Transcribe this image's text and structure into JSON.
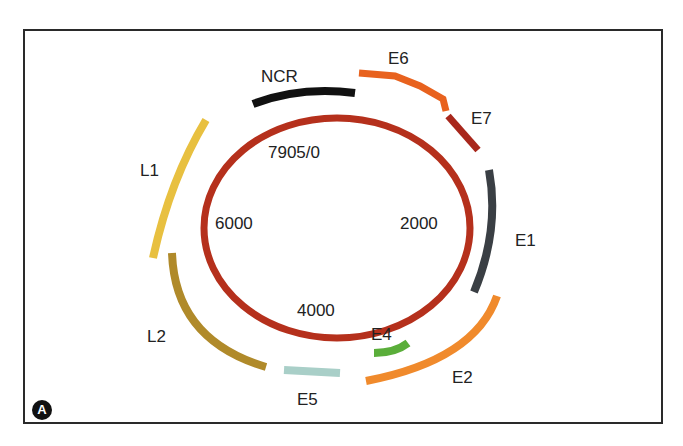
{
  "figure": {
    "panel_label": "A",
    "genome_positions": {
      "top": "7905/0",
      "right": "2000",
      "bottom": "4000",
      "left": "6000"
    },
    "regions": [
      {
        "name": "NCR",
        "label": "NCR",
        "color": "#111111"
      },
      {
        "name": "E6",
        "label": "E6",
        "color": "#e8621e"
      },
      {
        "name": "E7",
        "label": "E7",
        "color": "#a8271c"
      },
      {
        "name": "E1",
        "label": "E1",
        "color": "#3a3f44"
      },
      {
        "name": "E2",
        "label": "E2",
        "color": "#f08a2c"
      },
      {
        "name": "E4",
        "label": "E4",
        "color": "#5aae3a"
      },
      {
        "name": "E5",
        "label": "E5",
        "color": "#a9cfc8"
      },
      {
        "name": "L2",
        "label": "L2",
        "color": "#b08a2a"
      },
      {
        "name": "L1",
        "label": "L1",
        "color": "#e8c040"
      }
    ],
    "genome_ring_color": "#b5301c"
  }
}
